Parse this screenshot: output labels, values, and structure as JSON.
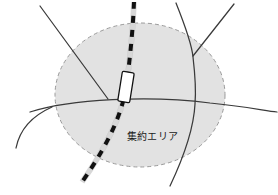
{
  "figure": {
    "name": "consolidation-area-map",
    "width": 278,
    "height": 195,
    "background_color": "#ffffff"
  },
  "area": {
    "label": "集約エリア",
    "fill_color": "#e2e2e2",
    "border_color": "#9a9a9a",
    "border_style": "dashed",
    "center_x": 140,
    "center_y": 95,
    "radius_x": 85,
    "radius_y": 72
  },
  "railway": {
    "name": "dashed-railway-line",
    "casing_color": "#ffffff",
    "dash_color": "#111111",
    "station": {
      "label": "",
      "fill_color": "#ffffff",
      "border_color": "#111111"
    }
  },
  "roads": {
    "color": "#3a3a3a",
    "items": [
      {
        "id": "road-northwest-diagonal"
      },
      {
        "id": "road-horizontal-main"
      },
      {
        "id": "road-northeast-branch"
      },
      {
        "id": "road-north-spur"
      },
      {
        "id": "road-southeast-curve"
      },
      {
        "id": "road-southwest-curve"
      }
    ]
  }
}
